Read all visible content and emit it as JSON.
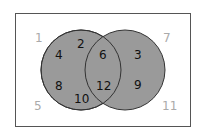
{
  "diagram": {
    "type": "venn",
    "universe_outside": [
      "1",
      "7",
      "5",
      "11"
    ],
    "set_a_only": [
      "2",
      "4",
      "8",
      "10"
    ],
    "intersection": [
      "6",
      "12"
    ],
    "set_b_only": [
      "3",
      "9"
    ],
    "labels": {
      "u1": "1",
      "u7": "7",
      "u5": "5",
      "u11": "11",
      "a2": "2",
      "a4": "4",
      "a8": "8",
      "a10": "10",
      "ab6": "6",
      "ab12": "12",
      "b3": "3",
      "b9": "9"
    },
    "colors": {
      "fill": "#9a9a9a",
      "stroke": "#333333",
      "frame": "#555555"
    }
  }
}
